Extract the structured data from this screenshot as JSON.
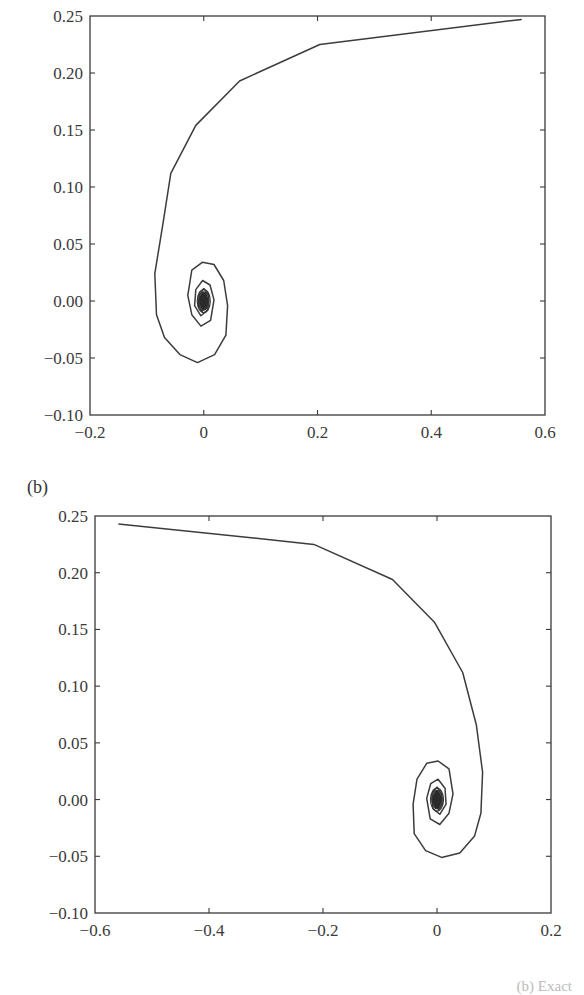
{
  "panels": [
    {
      "label": "",
      "id": "a"
    },
    {
      "label": "(b)",
      "id": "b"
    }
  ],
  "caption_fragment": "(b) Exact",
  "colors": {
    "line": "#3c3c3c",
    "axis": "#3a3a3a",
    "background": "#ffffff"
  },
  "chart_data": [
    {
      "type": "line",
      "title": "",
      "xlabel": "",
      "ylabel": "",
      "xlim": [
        -0.2,
        0.6
      ],
      "ylim": [
        -0.1,
        0.25
      ],
      "grid": false,
      "legend": null,
      "xticks": [
        -0.2,
        0,
        0.2,
        0.4,
        0.6
      ],
      "xtick_labels": [
        "−0.2",
        "0",
        "0.2",
        "0.4",
        "0.6"
      ],
      "yticks": [
        0.25,
        0.2,
        0.15,
        0.1,
        0.05,
        0.0,
        -0.05,
        -0.1
      ],
      "ytick_labels": [
        "0.25",
        "0.20",
        "0.15",
        "0.10",
        "0.05",
        "0.00",
        "−0.05",
        "−0.10"
      ],
      "series": [
        {
          "name": "trajectory",
          "x": [
            0.559,
            0.204,
            0.063,
            -0.014,
            -0.058,
            -0.072,
            -0.086,
            -0.083,
            -0.069,
            -0.042,
            -0.011,
            0.019,
            0.039,
            0.042,
            0.035,
            0.018,
            -0.002,
            -0.021,
            -0.028,
            -0.021,
            -0.005,
            0.012,
            0.018,
            0.011,
            -0.002,
            -0.014,
            -0.016,
            -0.005,
            0.007,
            0.009,
            0.0,
            -0.008,
            -0.009,
            -0.003,
            0.004,
            0.005,
            0.0
          ],
          "y": [
            0.247,
            0.225,
            0.193,
            0.154,
            0.112,
            0.067,
            0.024,
            -0.012,
            -0.032,
            -0.047,
            -0.054,
            -0.047,
            -0.03,
            -0.004,
            0.018,
            0.032,
            0.034,
            0.027,
            0.005,
            -0.012,
            -0.022,
            -0.017,
            0.001,
            0.014,
            0.018,
            0.01,
            -0.004,
            -0.013,
            -0.008,
            0.005,
            0.011,
            0.005,
            -0.004,
            -0.009,
            -0.004,
            0.003,
            0.0
          ]
        }
      ]
    },
    {
      "type": "line",
      "title": "(b)",
      "xlabel": "",
      "ylabel": "",
      "xlim": [
        -0.6,
        0.2
      ],
      "ylim": [
        -0.1,
        0.25
      ],
      "grid": false,
      "legend": null,
      "xticks": [
        -0.6,
        -0.4,
        -0.2,
        0,
        0.2
      ],
      "xtick_labels": [
        "−0.6",
        "−0.4",
        "−0.2",
        "0",
        "0.2"
      ],
      "yticks": [
        0.25,
        0.2,
        0.15,
        0.1,
        0.05,
        0.0,
        -0.05,
        -0.1
      ],
      "ytick_labels": [
        "0.25",
        "0.20",
        "0.15",
        "0.10",
        "0.05",
        "0.00",
        "−0.05",
        "−0.10"
      ],
      "series": [
        {
          "name": "trajectory",
          "x": [
            -0.559,
            -0.216,
            -0.078,
            -0.004,
            0.045,
            0.069,
            0.08,
            0.077,
            0.066,
            0.04,
            0.008,
            -0.02,
            -0.04,
            -0.042,
            -0.035,
            -0.018,
            0.002,
            0.021,
            0.028,
            0.021,
            0.005,
            -0.012,
            -0.018,
            -0.011,
            0.002,
            0.014,
            0.016,
            0.005,
            -0.007,
            -0.009,
            0.0,
            0.008,
            0.009,
            0.003,
            -0.004,
            -0.005,
            0.0
          ],
          "y": [
            0.243,
            0.225,
            0.194,
            0.156,
            0.112,
            0.066,
            0.024,
            -0.012,
            -0.032,
            -0.047,
            -0.051,
            -0.045,
            -0.03,
            -0.004,
            0.018,
            0.032,
            0.034,
            0.027,
            0.005,
            -0.012,
            -0.022,
            -0.017,
            0.001,
            0.014,
            0.018,
            0.01,
            -0.004,
            -0.013,
            -0.008,
            0.005,
            0.011,
            0.005,
            -0.004,
            -0.009,
            -0.004,
            0.003,
            0.0
          ]
        }
      ]
    }
  ]
}
